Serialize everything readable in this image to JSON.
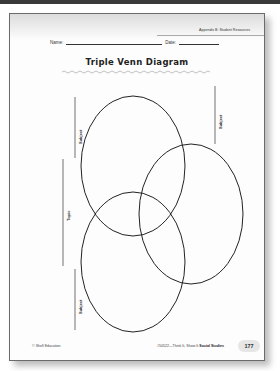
{
  "header": {
    "appendix_label": "Appendix B: Student Resources",
    "name_label": "Name:",
    "date_label": "Date:"
  },
  "title": "Triple Venn Diagram",
  "labels": {
    "subject_top_left": "Subject",
    "subject_right": "Subject",
    "subject_bottom_left": "Subject",
    "topic": "Topic"
  },
  "footer": {
    "copyright": "© Shell Education",
    "product_prefix": "#50522—Think It, Show It ",
    "product_bold": "Social Studies",
    "page_number": "177"
  },
  "colors": {
    "ink": "#222222",
    "page_border": "#6b6b6b",
    "page_bg": "#fdfdfd"
  }
}
